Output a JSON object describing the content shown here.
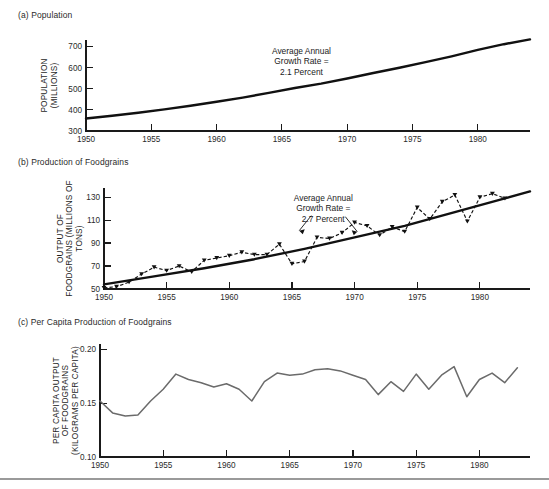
{
  "figure": {
    "panels": [
      {
        "key": "a",
        "title": "(a) Population"
      },
      {
        "key": "b",
        "title": "(b) Production of Foodgrains"
      },
      {
        "key": "c",
        "title": "(c) Per Capita Production of Foodgrains"
      }
    ]
  },
  "chart_data": [
    {
      "id": "population",
      "type": "line",
      "title": "(a) Population",
      "xlabel": "",
      "ylabel": "POPULATION (MILLIONS)",
      "ylabel_lines": [
        "POPULATION",
        "(MILLIONS)"
      ],
      "xlim": [
        1950,
        1984
      ],
      "ylim": [
        300,
        730
      ],
      "yticks": [
        300,
        400,
        500,
        600,
        700
      ],
      "ytick_labels": [
        "300",
        "400",
        "500",
        "600",
        "700"
      ],
      "xticks": [
        1950,
        1955,
        1960,
        1965,
        1970,
        1975,
        1980
      ],
      "xtick_labels": [
        "1950",
        "1955",
        "1960",
        "1965",
        "1970",
        "1975",
        "1980"
      ],
      "grid": false,
      "legend": "none",
      "annotation": {
        "lines": [
          "Average Annual",
          "Growth Rate =",
          "2.1 Percent"
        ],
        "at_x": 1966.5,
        "at_y": 665
      },
      "series": [
        {
          "name": "Population (millions)",
          "style": "solid-heavy",
          "x": [
            1950,
            1952,
            1954,
            1956,
            1958,
            1960,
            1962,
            1964,
            1966,
            1968,
            1970,
            1972,
            1974,
            1976,
            1978,
            1980,
            1982,
            1984
          ],
          "values": [
            359,
            372,
            386,
            402,
            419,
            438,
            458,
            480,
            503,
            524,
            548,
            574,
            599,
            625,
            653,
            683,
            710,
            733
          ]
        }
      ]
    },
    {
      "id": "foodgrain-production",
      "type": "line",
      "title": "(b) Production of Foodgrains",
      "xlabel": "",
      "ylabel": "OUTPUT OF FOODGRAINS (MILLIONS OF TONS)",
      "ylabel_lines": [
        "OUTPUT OF",
        "FOODGRAINS (MILLIONS OF",
        "TONS)"
      ],
      "xlim": [
        1950,
        1984
      ],
      "ylim": [
        50,
        138
      ],
      "yticks": [
        50,
        70,
        90,
        110,
        130
      ],
      "ytick_labels": [
        "50",
        "70",
        "90",
        "110",
        "130"
      ],
      "xticks": [
        1950,
        1955,
        1960,
        1965,
        1970,
        1975,
        1980
      ],
      "xtick_labels": [
        "1950",
        "1955",
        "1960",
        "1965",
        "1970",
        "1975",
        "1980"
      ],
      "grid": false,
      "legend": "none",
      "annotation": {
        "lines": [
          "Average Annual",
          "Growth Rate =",
          "2.7 Percent"
        ],
        "at_x": 1967.5,
        "at_y": 127
      },
      "series": [
        {
          "name": "Trend (fitted growth)",
          "style": "solid-heavy",
          "x": [
            1950,
            1954,
            1958,
            1962,
            1966,
            1970,
            1974,
            1978,
            1982,
            1984
          ],
          "values": [
            54,
            61,
            68,
            76,
            85,
            95,
            105,
            117,
            129,
            135
          ]
        },
        {
          "name": "Actual output",
          "style": "dashed-marker",
          "x": [
            1950,
            1951,
            1952,
            1953,
            1954,
            1955,
            1956,
            1957,
            1958,
            1959,
            1960,
            1961,
            1962,
            1963,
            1964,
            1965,
            1966,
            1967,
            1968,
            1969,
            1970,
            1971,
            1972,
            1973,
            1974,
            1975,
            1976,
            1977,
            1978,
            1979,
            1980,
            1981,
            1982,
            1983
          ],
          "values": [
            51,
            52,
            56,
            63,
            69,
            66,
            70,
            65,
            75,
            77,
            79,
            82,
            80,
            80,
            89,
            72,
            74,
            95,
            94,
            99,
            108,
            105,
            97,
            104,
            100,
            121,
            111,
            126,
            132,
            109,
            130,
            133,
            129,
            152
          ]
        }
      ]
    },
    {
      "id": "per-capita-foodgrain",
      "type": "line",
      "title": "(c) Per Capita Production of Foodgrains",
      "xlabel": "",
      "ylabel": "PER CAPITA OUTPUT OF FOODGRAINS (KILOGRAMS PER CAPITA)",
      "ylabel_lines": [
        "PER CAPITA OUTPUT",
        "OF FOODGRAINS",
        "(KILOGRAMS PER CAPITA)"
      ],
      "xlim": [
        1950,
        1984
      ],
      "ylim": [
        0.1,
        0.205
      ],
      "yticks": [
        0.1,
        0.15,
        0.2
      ],
      "ytick_labels": [
        "0.10",
        "0.15",
        "0.20"
      ],
      "xticks": [
        1950,
        1955,
        1960,
        1965,
        1970,
        1975,
        1980
      ],
      "xtick_labels": [
        "1950",
        "1955",
        "1960",
        "1965",
        "1970",
        "1975",
        "1980"
      ],
      "grid": false,
      "legend": "none",
      "series": [
        {
          "name": "Per capita output (kilograms per capita)",
          "style": "solid-grey",
          "x": [
            1950,
            1951,
            1952,
            1953,
            1954,
            1955,
            1956,
            1957,
            1958,
            1959,
            1960,
            1961,
            1962,
            1963,
            1964,
            1965,
            1966,
            1967,
            1968,
            1969,
            1970,
            1971,
            1972,
            1973,
            1974,
            1975,
            1976,
            1977,
            1978,
            1979,
            1980,
            1981,
            1982,
            1983
          ],
          "values": [
            0.152,
            0.141,
            0.138,
            0.139,
            0.152,
            0.163,
            0.177,
            0.172,
            0.169,
            0.165,
            0.168,
            0.163,
            0.152,
            0.17,
            0.178,
            0.176,
            0.177,
            0.181,
            0.182,
            0.18,
            0.176,
            0.172,
            0.158,
            0.17,
            0.161,
            0.177,
            0.163,
            0.176,
            0.184,
            0.156,
            0.172,
            0.178,
            0.169,
            0.183
          ]
        }
      ]
    }
  ]
}
